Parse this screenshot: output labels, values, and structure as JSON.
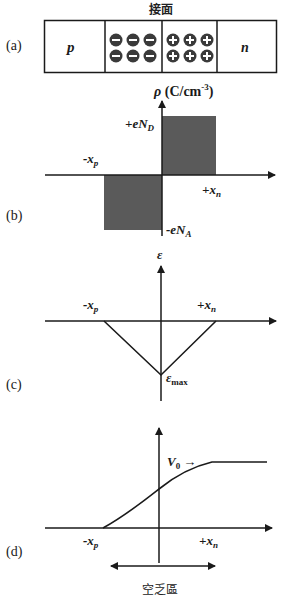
{
  "colors": {
    "line": "#1a1a1a",
    "charge_fill": "#5a5a5a",
    "ion_fill": "#3a3a3a",
    "ion_sign": "#ffffff"
  },
  "panel_a": {
    "label": "(a)",
    "junction_label": "接面",
    "p_label": "p",
    "n_label": "n",
    "negative_ion_sign": "−",
    "positive_ion_sign": "+",
    "negative_ion_count": 6,
    "positive_ion_count": 6
  },
  "panel_b": {
    "label": "(b)",
    "y_axis_label_symbol": "ρ",
    "y_axis_label_unit": "(C/cm",
    "y_axis_label_exp": "-3",
    "y_axis_label_close": ")",
    "pos_level": "+eN",
    "pos_sub": "D",
    "neg_level": "-eN",
    "neg_sub": "A",
    "xp_label": "-x",
    "xp_sub": "p",
    "xn_label": "+x",
    "xn_sub": "n"
  },
  "panel_c": {
    "label": "(c)",
    "y_axis_label": "ε",
    "max_label": "ε",
    "max_sub": "max",
    "xp_label": "-x",
    "xp_sub": "p",
    "xn_label": "+x",
    "xn_sub": "n"
  },
  "panel_d": {
    "label": "(d)",
    "v0_label": "V",
    "v0_sub": "0",
    "v0_arrow": "→",
    "xp_label": "-x",
    "xp_sub": "p",
    "xn_label": "+x",
    "xn_sub": "n",
    "depletion_label": "空乏區"
  }
}
